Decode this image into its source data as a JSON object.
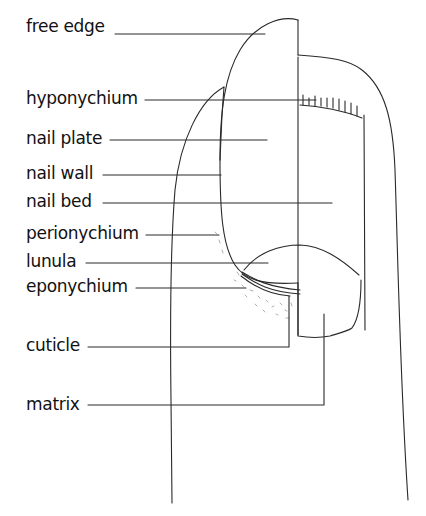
{
  "diagram": {
    "labels": [
      {
        "id": "free-edge",
        "text": "free edge",
        "x": 26,
        "y": 22
      },
      {
        "id": "hyponychium",
        "text": "hyponychium",
        "x": 26,
        "y": 95
      },
      {
        "id": "nail-plate",
        "text": "nail plate",
        "x": 26,
        "y": 134
      },
      {
        "id": "nail-wall",
        "text": "nail wall",
        "x": 26,
        "y": 168
      },
      {
        "id": "nail-bed",
        "text": "nail bed",
        "x": 26,
        "y": 196
      },
      {
        "id": "perionychium",
        "text": "perionychium",
        "x": 26,
        "y": 228
      },
      {
        "id": "lunula",
        "text": "lunula",
        "x": 26,
        "y": 256
      },
      {
        "id": "eponychium",
        "text": "eponychium",
        "x": 26,
        "y": 282
      },
      {
        "id": "cuticle",
        "text": "cuticle",
        "x": 26,
        "y": 343
      },
      {
        "id": "matrix",
        "text": "matrix",
        "x": 26,
        "y": 402
      }
    ],
    "colors": {
      "line": "#2a2a2a",
      "text": "#111111",
      "background": "#ffffff",
      "stipple": "#9a9a9a"
    }
  }
}
